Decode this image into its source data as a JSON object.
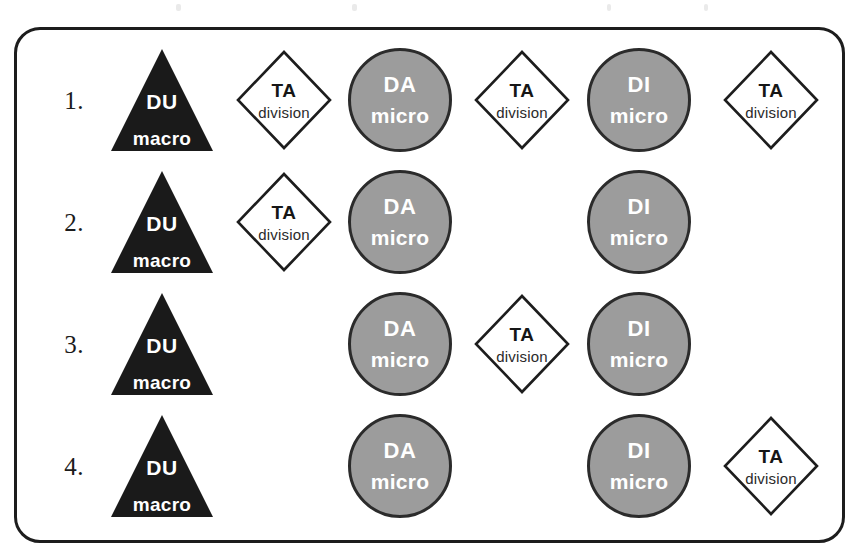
{
  "diagram": {
    "title": "",
    "frame": {
      "border_color": "#1d1d1d",
      "background": "#ffffff",
      "corner_radius": "26px"
    },
    "shape_styles": {
      "triangle_fill": "#1a1a1a",
      "triangle_text": "#ffffff",
      "circle_fill": "#9c9c9c",
      "circle_stroke": "#2b2b2b",
      "circle_text": "#ffffff",
      "diamond_fill": "#ffffff",
      "diamond_stroke": "#1d1d1d",
      "diamond_text": "#161616"
    },
    "legend_shapes": {
      "triangle": "DU macro",
      "circle_da": "DA micro",
      "circle_di": "DI micro",
      "diamond": "TA division"
    },
    "columns": [
      {
        "key": "du",
        "center_x": 162,
        "type": "triangle"
      },
      {
        "key": "ta1",
        "center_x": 284,
        "type": "diamond"
      },
      {
        "key": "da",
        "center_x": 400,
        "type": "circle"
      },
      {
        "key": "ta2",
        "center_x": 522,
        "type": "diamond"
      },
      {
        "key": "di",
        "center_x": 639,
        "type": "circle"
      },
      {
        "key": "ta3",
        "center_x": 771,
        "type": "diamond"
      }
    ],
    "rows": [
      {
        "number": "1.",
        "center_y": 100,
        "cells": [
          {
            "shape": "triangle",
            "main": "DU",
            "sub": "macro",
            "column": 0
          },
          {
            "shape": "diamond",
            "main": "TA",
            "sub": "division",
            "column": 1
          },
          {
            "shape": "circle",
            "main": "DA",
            "sub": "micro",
            "column": 2
          },
          {
            "shape": "diamond",
            "main": "TA",
            "sub": "division",
            "column": 3
          },
          {
            "shape": "circle",
            "main": "DI",
            "sub": "micro",
            "column": 4
          },
          {
            "shape": "diamond",
            "main": "TA",
            "sub": "division",
            "column": 5
          }
        ]
      },
      {
        "number": "2.",
        "center_y": 222,
        "cells": [
          {
            "shape": "triangle",
            "main": "DU",
            "sub": "macro",
            "column": 0
          },
          {
            "shape": "diamond",
            "main": "TA",
            "sub": "division",
            "column": 1
          },
          {
            "shape": "circle",
            "main": "DA",
            "sub": "micro",
            "column": 2
          },
          {
            "shape": "empty",
            "main": "",
            "sub": "",
            "column": 3
          },
          {
            "shape": "circle",
            "main": "DI",
            "sub": "micro",
            "column": 4
          },
          {
            "shape": "empty",
            "main": "",
            "sub": "",
            "column": 5
          }
        ]
      },
      {
        "number": "3.",
        "center_y": 344,
        "cells": [
          {
            "shape": "triangle",
            "main": "DU",
            "sub": "macro",
            "column": 0
          },
          {
            "shape": "empty",
            "main": "",
            "sub": "",
            "column": 1
          },
          {
            "shape": "circle",
            "main": "DA",
            "sub": "micro",
            "column": 2
          },
          {
            "shape": "diamond",
            "main": "TA",
            "sub": "division",
            "column": 3
          },
          {
            "shape": "circle",
            "main": "DI",
            "sub": "micro",
            "column": 4
          },
          {
            "shape": "empty",
            "main": "",
            "sub": "",
            "column": 5
          }
        ]
      },
      {
        "number": "4.",
        "center_y": 466,
        "cells": [
          {
            "shape": "triangle",
            "main": "DU",
            "sub": "macro",
            "column": 0
          },
          {
            "shape": "empty",
            "main": "",
            "sub": "",
            "column": 1
          },
          {
            "shape": "circle",
            "main": "DA",
            "sub": "micro",
            "column": 2
          },
          {
            "shape": "empty",
            "main": "",
            "sub": "",
            "column": 3
          },
          {
            "shape": "circle",
            "main": "DI",
            "sub": "micro",
            "column": 4
          },
          {
            "shape": "diamond",
            "main": "TA",
            "sub": "division",
            "column": 5
          }
        ]
      }
    ]
  }
}
